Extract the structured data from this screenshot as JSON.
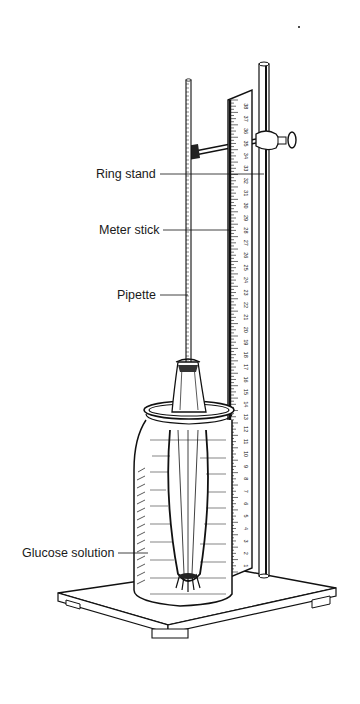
{
  "figure": {
    "labels": {
      "ring_stand": "Ring stand",
      "meter_stick": "Meter stick",
      "pipette": "Pipette",
      "glucose_solution": "Glucose solution"
    },
    "meter_stick_numbers": [
      "1",
      "2",
      "3",
      "4",
      "5",
      "6",
      "7",
      "8",
      "9",
      "10",
      "11",
      "12",
      "13",
      "14",
      "15",
      "16",
      "17",
      "18",
      "19",
      "20",
      "21",
      "22",
      "23",
      "24",
      "25",
      "26",
      "27",
      "28",
      "29",
      "30",
      "31",
      "32",
      "33",
      "34",
      "35",
      "36",
      "37",
      "38"
    ],
    "colors": {
      "ink": "#111111",
      "background": "#ffffff"
    }
  }
}
